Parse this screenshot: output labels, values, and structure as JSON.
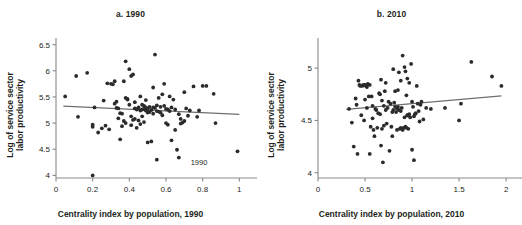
{
  "figure": {
    "background": "#ffffff",
    "point_color": "#2b2b2b",
    "axis_color": "#8a8a8a",
    "trend_color": "#6e6e6e",
    "text_color": "#231f20"
  },
  "panels": [
    {
      "key": "a",
      "title": "a. 1990",
      "xlabel": "Centrality index by population, 1990",
      "ylabel_line1": "Log of service sector",
      "ylabel_line2": "labor productivity",
      "annotation": "1990"
    },
    {
      "key": "b",
      "title": "b. 2010",
      "xlabel": "Centrality index by population, 2010",
      "ylabel_line1": "Log of service sector",
      "ylabel_line2": "labor productivity",
      "annotation": ""
    }
  ],
  "chart_data": [
    {
      "type": "scatter",
      "panel": "a",
      "title": "a. 1990",
      "xlabel": "Centrality index by population, 1990",
      "ylabel": "Log of service sector labor productivity",
      "xlim": [
        0,
        1.02
      ],
      "ylim": [
        3.95,
        6.55
      ],
      "xticks": [
        0,
        0.2,
        0.4,
        0.6,
        0.8,
        1
      ],
      "xticklabels": [
        "0",
        "0.2",
        "0.4",
        "0.6",
        "0.8",
        "1"
      ],
      "yticks": [
        4,
        4.5,
        5,
        5.5,
        6,
        6.5
      ],
      "yticklabels": [
        "4",
        "4.5",
        "5",
        "5.5",
        "6",
        "6.5"
      ],
      "grid": false,
      "legend": "none",
      "annotations": [
        {
          "text": "1990",
          "x": 0.78,
          "y": 4.2
        }
      ],
      "trendline": {
        "x0": 0.04,
        "y0": 5.325,
        "x1": 1.0,
        "y1": 5.165,
        "slope": -0.167
      },
      "x": [
        0.05,
        0.11,
        0.12,
        0.17,
        0.2,
        0.2,
        0.2,
        0.21,
        0.23,
        0.25,
        0.26,
        0.27,
        0.28,
        0.29,
        0.3,
        0.31,
        0.32,
        0.32,
        0.33,
        0.33,
        0.34,
        0.34,
        0.35,
        0.35,
        0.36,
        0.36,
        0.37,
        0.37,
        0.38,
        0.38,
        0.38,
        0.39,
        0.39,
        0.4,
        0.4,
        0.41,
        0.41,
        0.41,
        0.42,
        0.42,
        0.43,
        0.43,
        0.43,
        0.44,
        0.44,
        0.45,
        0.45,
        0.46,
        0.46,
        0.46,
        0.47,
        0.47,
        0.47,
        0.48,
        0.48,
        0.48,
        0.49,
        0.49,
        0.49,
        0.5,
        0.5,
        0.5,
        0.51,
        0.51,
        0.52,
        0.52,
        0.53,
        0.53,
        0.53,
        0.54,
        0.54,
        0.55,
        0.55,
        0.55,
        0.56,
        0.56,
        0.57,
        0.57,
        0.58,
        0.58,
        0.59,
        0.59,
        0.6,
        0.6,
        0.61,
        0.61,
        0.62,
        0.62,
        0.63,
        0.63,
        0.64,
        0.65,
        0.65,
        0.66,
        0.67,
        0.67,
        0.68,
        0.68,
        0.69,
        0.7,
        0.7,
        0.71,
        0.72,
        0.73,
        0.75,
        0.77,
        0.78,
        0.8,
        0.82,
        0.86,
        0.87,
        0.99
      ],
      "y": [
        5.51,
        5.9,
        5.12,
        5.96,
        4.0,
        4.93,
        4.97,
        5.3,
        4.82,
        4.9,
        5.43,
        4.95,
        5.76,
        4.88,
        5.75,
        5.74,
        5.8,
        5.37,
        5.41,
        5.29,
        5.09,
        5.28,
        4.69,
        5.19,
        5.18,
        4.94,
        5.8,
        5.04,
        6.18,
        5.48,
        5.0,
        5.46,
        5.45,
        6.03,
        5.35,
        5.9,
        5.13,
        4.96,
        5.93,
        5.06,
        5.4,
        5.28,
        5.08,
        5.26,
        4.91,
        5.3,
        5.05,
        5.51,
        5.24,
        4.98,
        5.35,
        5.26,
        5.13,
        5.33,
        5.27,
        5.02,
        5.44,
        5.3,
        5.24,
        5.27,
        5.2,
        4.63,
        5.31,
        5.21,
        5.25,
        4.65,
        5.68,
        5.3,
        5.18,
        6.31,
        5.29,
        5.23,
        5.34,
        4.3,
        5.48,
        5.22,
        5.31,
        5.2,
        5.55,
        5.15,
        5.75,
        5.33,
        5.27,
        5.0,
        5.26,
        4.97,
        5.51,
        5.23,
        5.3,
        4.67,
        5.45,
        5.26,
        4.87,
        4.49,
        5.17,
        4.34,
        5.08,
        4.99,
        5.01,
        5.59,
        5.04,
        5.28,
        5.14,
        5.24,
        5.7,
        5.12,
        5.24,
        5.71,
        5.71,
        5.56,
        5.0,
        4.46
      ]
    },
    {
      "type": "scatter",
      "panel": "b",
      "title": "b. 2010",
      "xlabel": "Centrality index by population, 2010",
      "ylabel": "Log of service sector labor productivity",
      "xlim": [
        0,
        2.02
      ],
      "ylim": [
        3.95,
        5.25
      ],
      "xticks": [
        0,
        0.5,
        1,
        1.5,
        2
      ],
      "xticklabels": [
        "0",
        "0.5",
        "1",
        "1.5",
        "2"
      ],
      "yticks": [
        4,
        4.5,
        5
      ],
      "yticklabels": [
        "4",
        "4.5",
        "5"
      ],
      "grid": false,
      "legend": "none",
      "annotations": [],
      "trendline": {
        "x0": 0.3,
        "y0": 4.605,
        "x1": 1.95,
        "y1": 4.735,
        "slope": 0.079
      },
      "x": [
        0.33,
        0.36,
        0.38,
        0.4,
        0.41,
        0.42,
        0.44,
        0.45,
        0.46,
        0.47,
        0.48,
        0.49,
        0.5,
        0.5,
        0.51,
        0.52,
        0.52,
        0.53,
        0.54,
        0.55,
        0.55,
        0.56,
        0.57,
        0.58,
        0.59,
        0.6,
        0.61,
        0.62,
        0.63,
        0.64,
        0.65,
        0.66,
        0.66,
        0.67,
        0.68,
        0.68,
        0.69,
        0.7,
        0.7,
        0.71,
        0.72,
        0.73,
        0.74,
        0.75,
        0.76,
        0.77,
        0.78,
        0.79,
        0.8,
        0.8,
        0.81,
        0.82,
        0.82,
        0.83,
        0.84,
        0.84,
        0.85,
        0.85,
        0.86,
        0.86,
        0.87,
        0.88,
        0.88,
        0.89,
        0.9,
        0.9,
        0.91,
        0.92,
        0.92,
        0.93,
        0.93,
        0.94,
        0.94,
        0.95,
        0.95,
        0.96,
        0.97,
        0.97,
        0.98,
        0.99,
        1.0,
        1.0,
        1.01,
        1.02,
        1.03,
        1.04,
        1.05,
        1.06,
        1.07,
        1.08,
        1.09,
        1.1,
        1.12,
        1.15,
        1.2,
        1.35,
        1.5,
        1.52,
        1.63,
        1.85,
        1.95,
        0.43,
        0.51,
        0.67,
        0.72,
        0.88,
        0.95,
        1.02,
        0.58,
        0.79
      ],
      "y": [
        4.61,
        4.48,
        4.25,
        4.71,
        4.65,
        4.18,
        4.84,
        4.83,
        4.55,
        4.83,
        4.84,
        4.5,
        4.84,
        4.7,
        4.83,
        4.82,
        4.62,
        4.85,
        4.73,
        4.84,
        4.18,
        4.44,
        4.73,
        4.52,
        4.41,
        4.35,
        4.61,
        4.6,
        4.43,
        4.57,
        4.76,
        4.75,
        4.56,
        4.26,
        4.69,
        4.42,
        4.1,
        4.64,
        4.45,
        4.78,
        4.6,
        4.47,
        4.62,
        4.68,
        4.21,
        4.66,
        4.44,
        4.35,
        4.99,
        4.6,
        4.67,
        4.78,
        4.63,
        4.58,
        4.61,
        4.41,
        4.79,
        4.63,
        4.96,
        4.6,
        4.42,
        4.43,
        4.59,
        4.62,
        5.12,
        4.41,
        4.43,
        5.01,
        4.53,
        4.97,
        4.44,
        4.74,
        4.43,
        4.9,
        4.55,
        4.42,
        4.86,
        4.56,
        4.53,
        5.04,
        4.68,
        4.22,
        4.63,
        4.12,
        4.56,
        4.57,
        4.83,
        4.66,
        4.59,
        4.49,
        4.65,
        4.68,
        4.51,
        4.62,
        4.61,
        4.62,
        4.5,
        4.66,
        5.06,
        4.92,
        4.83,
        4.88,
        4.84,
        4.89,
        4.86,
        4.88,
        4.55,
        4.54,
        4.64,
        4.58
      ]
    }
  ]
}
